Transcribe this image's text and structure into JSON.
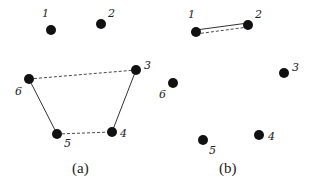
{
  "panels": [
    {
      "caption": "(a)",
      "nodes": [
        {
          "id": "1",
          "x": 51,
          "y": 30
        },
        {
          "id": "2",
          "x": 101,
          "y": 24
        },
        {
          "id": "3",
          "x": 136,
          "y": 70
        },
        {
          "id": "4",
          "x": 112,
          "y": 132
        },
        {
          "id": "5",
          "x": 57,
          "y": 134
        },
        {
          "id": "6",
          "x": 29,
          "y": 79
        }
      ],
      "edges": [
        {
          "from": "6",
          "to": "3",
          "style": "dashed"
        },
        {
          "from": "6",
          "to": "5",
          "style": "solid"
        },
        {
          "from": "3",
          "to": "4",
          "style": "solid"
        },
        {
          "from": "5",
          "to": "4",
          "style": "dashed"
        }
      ]
    },
    {
      "caption": "(b)",
      "nodes": [
        {
          "id": "1",
          "x": 196,
          "y": 32
        },
        {
          "id": "2",
          "x": 248,
          "y": 25
        },
        {
          "id": "3",
          "x": 284,
          "y": 73
        },
        {
          "id": "4",
          "x": 259,
          "y": 135
        },
        {
          "id": "5",
          "x": 203,
          "y": 140
        },
        {
          "id": "6",
          "x": 173,
          "y": 83
        }
      ],
      "edges": [
        {
          "from": "1",
          "to": "2",
          "style": "solid"
        },
        {
          "from": "1",
          "to": "2",
          "style": "dashed"
        }
      ]
    }
  ],
  "colors": {
    "node": "#111111",
    "edge": "#333333",
    "background": "#ffffff"
  }
}
